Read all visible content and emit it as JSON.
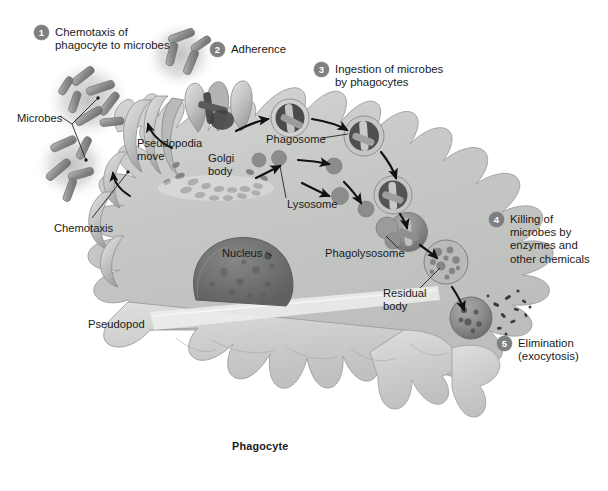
{
  "figure": {
    "organism_label": "Phagocyte",
    "palette": {
      "background": "#ffffff",
      "cytoplasm": "#c9cbc9",
      "cytoplasm_light": "#dddedc",
      "membrane_edge": "#8f9190",
      "nucleus": "#6f7170",
      "badge_gray": "#7d7f80",
      "badge_text": "#ffffff",
      "text": "#1a1a1a",
      "microbe_gray": "#8a8c8b",
      "halo_gray": "#d9dad8",
      "arrow": "#121212"
    }
  },
  "steps": [
    {
      "number": "1",
      "label": "Chemotaxis of\nphagocyte to microbes",
      "x": 34,
      "y": 25
    },
    {
      "number": "2",
      "label": "Adherence",
      "x": 210,
      "y": 42
    },
    {
      "number": "3",
      "label": "Ingestion of microbes\nby phagocytes",
      "x": 314,
      "y": 62
    },
    {
      "number": "4",
      "label": "Killing of\nmicrobes by\nenzymes and\nother chemicals",
      "x": 489,
      "y": 212
    },
    {
      "number": "5",
      "label": "Elimination\n(exocytosis)",
      "x": 497,
      "y": 336
    }
  ],
  "annotations": [
    {
      "name": "microbes",
      "text": "Microbes",
      "x": 17,
      "y": 112
    },
    {
      "name": "chemotaxis",
      "text": "Chemotaxis",
      "x": 54,
      "y": 222
    },
    {
      "name": "pseudopodia-move",
      "text": "Pseudopodia\nmove",
      "x": 137,
      "y": 137
    },
    {
      "name": "golgi-body",
      "text": "Golgi\nbody",
      "x": 208,
      "y": 152
    },
    {
      "name": "phagosome",
      "text": "Phagosome",
      "x": 266,
      "y": 133
    },
    {
      "name": "lysosome",
      "text": "Lysosome",
      "x": 287,
      "y": 198
    },
    {
      "name": "nucleus",
      "text": "Nucleus",
      "x": 222,
      "y": 247
    },
    {
      "name": "phagolysosome",
      "text": "Phagolysosome",
      "x": 325,
      "y": 247
    },
    {
      "name": "residual-body",
      "text": "Residual\nbody",
      "x": 383,
      "y": 287
    },
    {
      "name": "pseudopod",
      "text": "Pseudopod",
      "x": 88,
      "y": 318
    },
    {
      "name": "phagocyte",
      "text": "Phagocyte",
      "x": 232,
      "y": 440,
      "bold": true
    }
  ],
  "microbe_clusters": [
    {
      "name": "cluster-upper-left",
      "cx": 88,
      "cy": 100,
      "r": 40,
      "count": 7
    },
    {
      "name": "cluster-lower-left",
      "cx": 72,
      "cy": 163,
      "r": 34,
      "count": 5
    },
    {
      "name": "cluster-top-center",
      "cx": 180,
      "cy": 55,
      "r": 33,
      "count": 4
    }
  ],
  "pathway_stages": [
    {
      "name": "adherence-site",
      "stage": "microbe bound at pseudopodia"
    },
    {
      "name": "phagosome-1",
      "stage": "phagosome forming"
    },
    {
      "name": "phagosome-2",
      "stage": "phagosome internalized"
    },
    {
      "name": "lysosome-fusion",
      "stage": "lysosome fusing"
    },
    {
      "name": "phagolysosome",
      "stage": "phagolysosome digesting"
    },
    {
      "name": "residual-body",
      "stage": "residual body"
    },
    {
      "name": "exocytosis",
      "stage": "debris released"
    }
  ]
}
